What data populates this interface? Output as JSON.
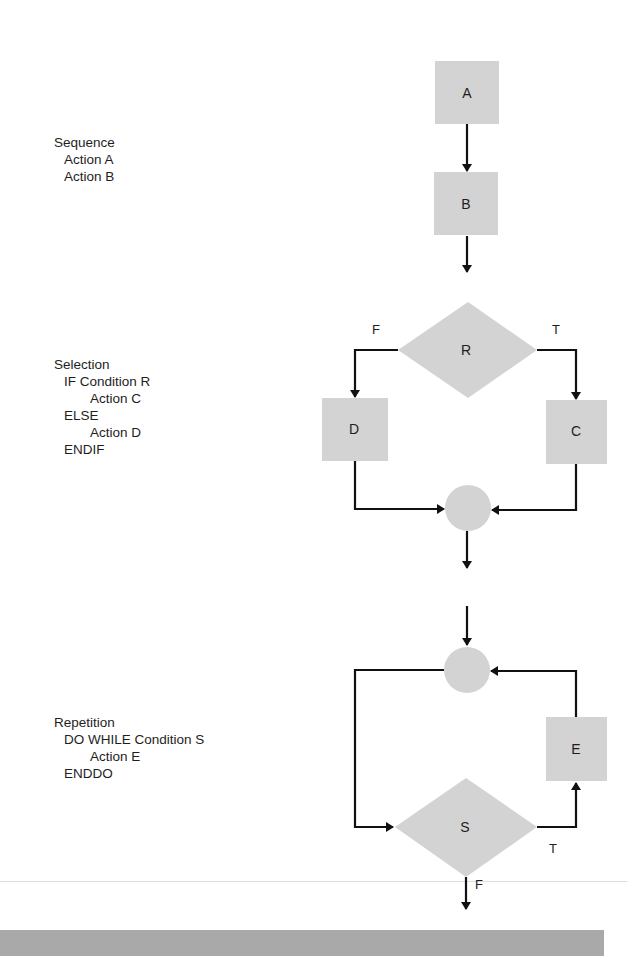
{
  "sections": {
    "sequence": {
      "title": "Sequence",
      "lines": [
        "Action A",
        "Action B"
      ]
    },
    "selection": {
      "title": "Selection",
      "lines": [
        "IF Condition R",
        "Action C",
        "ELSE",
        "Action D",
        "ENDIF"
      ]
    },
    "repetition": {
      "title": "Repetition",
      "lines": [
        "DO WHILE Condition S",
        "Action E",
        "ENDDO"
      ]
    }
  },
  "nodes": {
    "A": "A",
    "B": "B",
    "R": "R",
    "C": "C",
    "D": "D",
    "S": "S",
    "E": "E"
  },
  "edge_labels": {
    "selection_false": "F",
    "selection_true": "T",
    "repetition_true": "T",
    "repetition_false": "F"
  },
  "colors": {
    "shape_fill": "#d3d3d3",
    "line": "#111111",
    "band": "#a9a9a9"
  }
}
